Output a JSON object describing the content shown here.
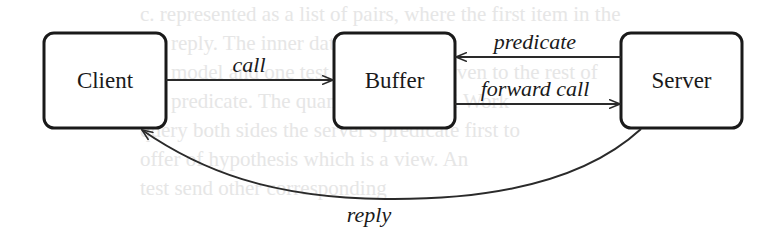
{
  "diagram": {
    "type": "message-flow",
    "nodes": [
      {
        "id": "client",
        "label": "Client"
      },
      {
        "id": "buffer",
        "label": "Buffer"
      },
      {
        "id": "server",
        "label": "Server"
      }
    ],
    "edges": [
      {
        "id": "call",
        "from": "client",
        "to": "buffer",
        "label": "call"
      },
      {
        "id": "predicate",
        "from": "server",
        "to": "buffer",
        "label": "predicate"
      },
      {
        "id": "forward_call",
        "from": "buffer",
        "to": "server",
        "label": "forward call"
      },
      {
        "id": "reply",
        "from": "server",
        "to": "client",
        "label": "reply"
      }
    ],
    "colors": {
      "stroke": "#1a1a1a",
      "background": "#ffffff",
      "bleed_text": "#e6e6e6"
    }
  },
  "background_bleed": [
    "c. represented as a list of pairs, where the first item in the",
    "the reply. The inner data are ordered",
    "the model and one test generated is given to the rest of",
    "the predicate. The quantification of Pi Work",
    "query both sides the server's predicate first to",
    "offer of hypothesis which is a view. An",
    "test send other corresponding"
  ]
}
